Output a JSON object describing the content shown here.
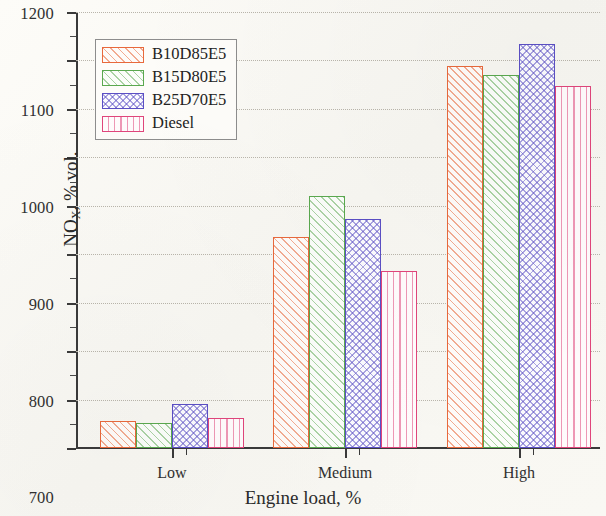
{
  "chart_data": {
    "type": "bar",
    "title": "",
    "xlabel": "Engine load, %",
    "ylabel": "NO",
    "ylabel_sub": "X",
    "ylabel_rest": ", % vol.",
    "categories": [
      "Low",
      "Medium",
      "High"
    ],
    "series": [
      {
        "name": "B10D85E5",
        "color": "#e8693c",
        "pattern": "diagonal",
        "values": [
          356,
          735,
          1088
        ]
      },
      {
        "name": "B15D80E5",
        "color": "#5aa84f",
        "pattern": "diagonal",
        "values": [
          352,
          820,
          1070
        ]
      },
      {
        "name": "B25D70E5",
        "color": "#5b4fc4",
        "pattern": "crosshatch",
        "values": [
          391,
          773,
          1135
        ]
      },
      {
        "name": "Diesel",
        "color": "#e0457b",
        "pattern": "vertical",
        "values": [
          362,
          665,
          1047
        ]
      }
    ],
    "ylim": [
      300,
      1200
    ],
    "ytick_step": 100,
    "yminor_step": 50,
    "yticks": [
      300,
      400,
      500,
      600,
      700,
      800,
      900,
      1000,
      1100,
      1200
    ],
    "ytick_labels": [
      "300",
      "400",
      "500",
      "600",
      "700",
      "800",
      "900",
      "1000",
      "1100",
      "1200"
    ],
    "grid": true,
    "grid_axis": "y",
    "legend_position": "upper-left"
  },
  "legend": {
    "entries": [
      {
        "label": "B10D85E5"
      },
      {
        "label": "B15D80E5"
      },
      {
        "label": "B25D70E5"
      },
      {
        "label": "Diesel"
      }
    ]
  },
  "axes": {
    "x_title": "Engine load, %",
    "y_title_main": "NO",
    "y_title_sub": "X",
    "y_title_tail": ", % vol."
  }
}
